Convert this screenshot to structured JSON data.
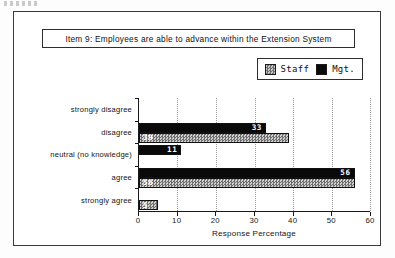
{
  "title": {
    "text": "Item 9:  Employees are able to advance within the Extension System"
  },
  "legend": {
    "position": "top-right",
    "items": [
      {
        "label": "Staff",
        "swatch": "staff-hatched-swatch",
        "color": "#8f8f8f"
      },
      {
        "label": "Mgt.",
        "swatch": "mgt-solid-swatch",
        "color": "#0b0b0b"
      }
    ]
  },
  "chart_data": {
    "type": "bar",
    "orientation": "horizontal",
    "title": "Item 9:  Employees are able to advance within the Extension System",
    "xlabel": "Response Percentage",
    "ylabel": "",
    "xlim": [
      0,
      60
    ],
    "xticks": [
      0,
      10,
      20,
      30,
      40,
      50,
      60
    ],
    "grid": "vertical-dotted",
    "legend_position": "top-right",
    "categories": [
      "strongly  disagree",
      "disagree",
      "neutral (no knowledge)",
      "agree",
      "strongly  agree"
    ],
    "series": [
      {
        "name": "Mgt.",
        "color": "#0b0b0b",
        "values": [
          0,
          33,
          11,
          56,
          0
        ],
        "labels": [
          "",
          "33",
          "11",
          "56",
          ""
        ]
      },
      {
        "name": "Staff",
        "color": "#8f8f8f",
        "values": [
          0,
          39,
          0,
          56,
          5
        ],
        "labels": [
          "",
          "39",
          "",
          "56",
          "5"
        ]
      }
    ]
  }
}
